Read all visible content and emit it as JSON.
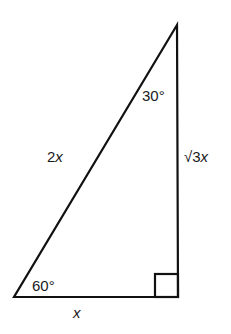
{
  "diagram": {
    "stroke_color": "#111111",
    "vertices": {
      "top": {
        "x": 177,
        "y": 25
      },
      "bottom_left": {
        "x": 14,
        "y": 297
      },
      "bottom_right": {
        "x": 178,
        "y": 297
      }
    },
    "labels": {
      "angle_top": "30°",
      "angle_bottom_left": "60°",
      "hypotenuse": "2x",
      "hypotenuse_coef": "2",
      "hypotenuse_var": "x",
      "vertical_side": "√3x",
      "vertical_side_coef": "√3",
      "vertical_side_var": "x",
      "base": "x"
    },
    "right_angle_marker": true
  }
}
